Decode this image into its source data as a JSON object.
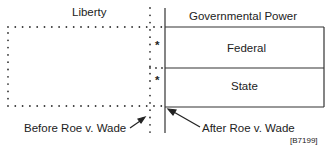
{
  "diagram": {
    "liberty_label": "Liberty",
    "government_label": "Governmental Power",
    "federal_label": "Federal",
    "state_label": "State",
    "before_label": "Before Roe v. Wade",
    "after_label": "After Roe v. Wade",
    "asterisk": "*",
    "figure_id": "[B7199]"
  }
}
